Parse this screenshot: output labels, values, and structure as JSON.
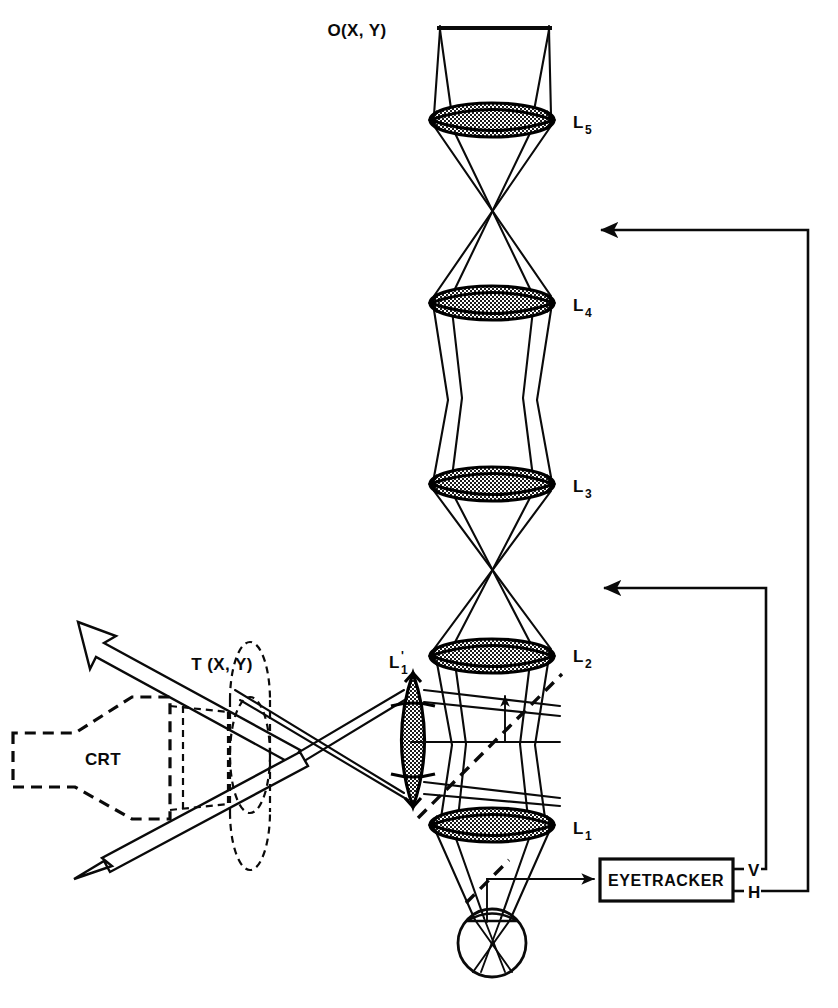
{
  "figure": {
    "kind": "optical-ray-diagram",
    "title_text": "",
    "background": "#ffffff",
    "ink_color": "#0a0a0a"
  },
  "labels": {
    "object_plane": "O(X, Y)",
    "crt": "CRT",
    "target_plane": "T (X, Y)",
    "eyetracker": "EYETRACKER",
    "vertical_output": "V",
    "horizontal_output": "H"
  },
  "lenses": [
    {
      "id": "L5",
      "base": "L",
      "sub": "5",
      "prime": "",
      "orientation": "horizontal",
      "cx": 492,
      "cy": 120,
      "rx": 62,
      "ry": 17
    },
    {
      "id": "L4",
      "base": "L",
      "sub": "4",
      "prime": "",
      "orientation": "horizontal",
      "cx": 492,
      "cy": 303,
      "rx": 62,
      "ry": 17
    },
    {
      "id": "L3",
      "base": "L",
      "sub": "3",
      "prime": "",
      "orientation": "horizontal",
      "cx": 492,
      "cy": 484,
      "rx": 62,
      "ry": 17
    },
    {
      "id": "L2",
      "base": "L",
      "sub": "2",
      "prime": "",
      "orientation": "horizontal",
      "cx": 492,
      "cy": 656,
      "rx": 62,
      "ry": 17
    },
    {
      "id": "L1",
      "base": "L",
      "sub": "1",
      "prime": "",
      "orientation": "horizontal",
      "cx": 492,
      "cy": 825,
      "rx": 62,
      "ry": 17
    },
    {
      "id": "L1prime",
      "base": "L",
      "sub": "1",
      "prime": "'",
      "orientation": "vertical",
      "cx": 413,
      "cy": 740,
      "rx": 21,
      "ry": 67
    }
  ],
  "lens_labels": [
    {
      "id": "L5",
      "x": 573,
      "y": 128
    },
    {
      "id": "L4",
      "x": 573,
      "y": 311
    },
    {
      "id": "L3",
      "x": 573,
      "y": 492
    },
    {
      "id": "L2",
      "x": 573,
      "y": 662
    },
    {
      "id": "L1",
      "x": 573,
      "y": 834
    },
    {
      "id": "L1prime",
      "x": 389,
      "y": 668
    }
  ],
  "components": {
    "object_bar": {
      "x1": 437,
      "x2": 552,
      "y": 28
    },
    "eye": {
      "cx": 492,
      "cy": 943,
      "r": 34
    },
    "eyetracker_box": {
      "x": 600,
      "y": 859,
      "w": 133,
      "h": 42
    },
    "crt_label_pos": {
      "x": 103,
      "y": 758
    },
    "target_label_pos": {
      "x": 222,
      "y": 670
    },
    "object_label_pos": {
      "x": 357,
      "y": 36
    }
  },
  "feedback_paths": [
    {
      "name": "horizontal-feedback",
      "from": "H",
      "to_y": 230,
      "vertical_x": 808,
      "arrow_x": 597,
      "label": "H"
    },
    {
      "name": "vertical-feedback",
      "from": "V",
      "to_y": 588,
      "vertical_x": 766,
      "arrow_x": 600,
      "label": "V"
    }
  ],
  "beam_arrows": {
    "upper_hollow_arrow": {
      "direction": "up-left",
      "tip_x": 78,
      "tip_y": 622
    },
    "lower_hollow_arrow": {
      "direction": "down-left",
      "tip_x": 74,
      "tip_y": 879
    }
  }
}
